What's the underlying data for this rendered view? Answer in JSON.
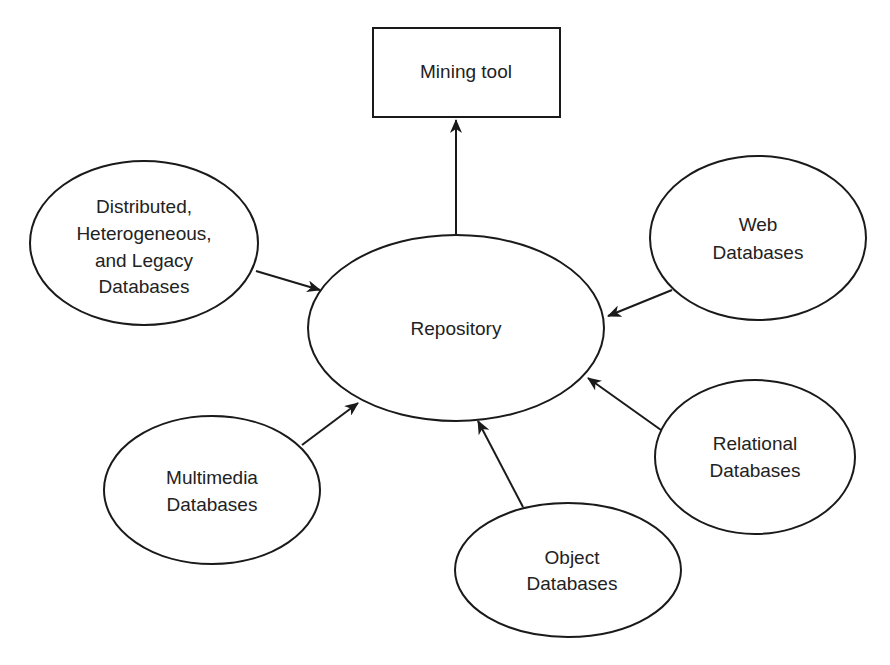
{
  "diagram": {
    "nodes": {
      "mining_tool": {
        "shape": "rectangle",
        "lines": [
          "Mining tool"
        ]
      },
      "repository": {
        "shape": "ellipse",
        "lines": [
          "Repository"
        ]
      },
      "distributed": {
        "shape": "ellipse",
        "lines": [
          "Distributed,",
          "Heterogeneous,",
          "and Legacy",
          "Databases"
        ]
      },
      "web": {
        "shape": "ellipse",
        "lines": [
          "Web",
          "Databases"
        ]
      },
      "relational": {
        "shape": "ellipse",
        "lines": [
          "Relational",
          "Databases"
        ]
      },
      "multimedia": {
        "shape": "ellipse",
        "lines": [
          "Multimedia",
          "Databases"
        ]
      },
      "object": {
        "shape": "ellipse",
        "lines": [
          "Object",
          "Databases"
        ]
      }
    },
    "edges": [
      {
        "from": "repository",
        "to": "mining_tool"
      },
      {
        "from": "distributed",
        "to": "repository"
      },
      {
        "from": "web",
        "to": "repository"
      },
      {
        "from": "relational",
        "to": "repository"
      },
      {
        "from": "multimedia",
        "to": "repository"
      },
      {
        "from": "object",
        "to": "repository"
      }
    ],
    "colors": {
      "stroke": "#1a1a1a",
      "text": "#222222",
      "background": "#ffffff"
    }
  }
}
